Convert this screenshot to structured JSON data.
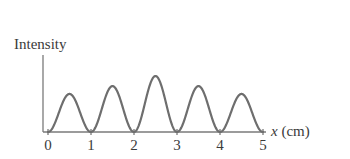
{
  "chart_data": {
    "type": "line",
    "title": "",
    "xlabel": "x (cm)",
    "xlabel_var": "x",
    "xlabel_unit": "(cm)",
    "ylabel": "Intensity",
    "xlim": [
      0,
      5
    ],
    "ylim": [
      0,
      1
    ],
    "grid": false,
    "legend": null,
    "x_ticks": [
      "0",
      "1",
      "2",
      "3",
      "4",
      "5"
    ],
    "y_ticks": [],
    "peaks": [
      {
        "x": 0.5,
        "y": 0.68
      },
      {
        "x": 1.5,
        "y": 0.82
      },
      {
        "x": 2.5,
        "y": 1.0
      },
      {
        "x": 3.5,
        "y": 0.82
      },
      {
        "x": 4.5,
        "y": 0.68
      }
    ],
    "minima_x": [
      0,
      1,
      2,
      3,
      4,
      5
    ],
    "series": [
      {
        "name": "Intensity",
        "color": "#6e6e6e",
        "x": [
          0,
          0.5,
          1,
          1.5,
          2,
          2.5,
          3,
          3.5,
          4,
          4.5,
          5
        ],
        "values": [
          0,
          0.68,
          0,
          0.82,
          0,
          1.0,
          0,
          0.82,
          0,
          0.68,
          0
        ]
      }
    ]
  },
  "axes": {
    "color": "#6e6e6e",
    "curve_color": "#6e6e6e"
  }
}
